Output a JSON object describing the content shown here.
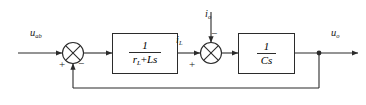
{
  "diagram": {
    "type": "control-block-diagram",
    "line_color": "#2b2b2b",
    "background": "#ffffff",
    "signals": {
      "input": {
        "base": "u",
        "subscript": "ab",
        "name": "u_ab"
      },
      "inductor_current": {
        "base": "i",
        "subscript": "L",
        "name": "i_L"
      },
      "disturbance": {
        "base": "i",
        "subscript": "o",
        "name": "i_o"
      },
      "output": {
        "base": "u",
        "subscript": "o",
        "name": "u_o"
      }
    },
    "blocks": [
      {
        "id": "plant-inductor",
        "numerator": "1",
        "denominator_prefix": "r",
        "denominator_subscript": "L",
        "denominator_operator": "+",
        "denominator_suffix": "Ls",
        "label": "1/(r_L+Ls)"
      },
      {
        "id": "plant-capacitor",
        "numerator": "1",
        "denominator_prefix": "Cs",
        "denominator_subscript": "",
        "denominator_operator": "",
        "denominator_suffix": "",
        "label": "1/Cs"
      }
    ],
    "summing_junctions": [
      {
        "id": "junction-1",
        "inputs": [
          {
            "port": "left",
            "sign": "+"
          },
          {
            "port": "bottom",
            "sign": "−"
          }
        ]
      },
      {
        "id": "junction-2",
        "inputs": [
          {
            "port": "left",
            "sign": "+"
          },
          {
            "port": "top",
            "sign": "−"
          }
        ]
      }
    ],
    "feedback": {
      "type": "unity",
      "from": "output-tap",
      "to": "junction-1"
    }
  }
}
